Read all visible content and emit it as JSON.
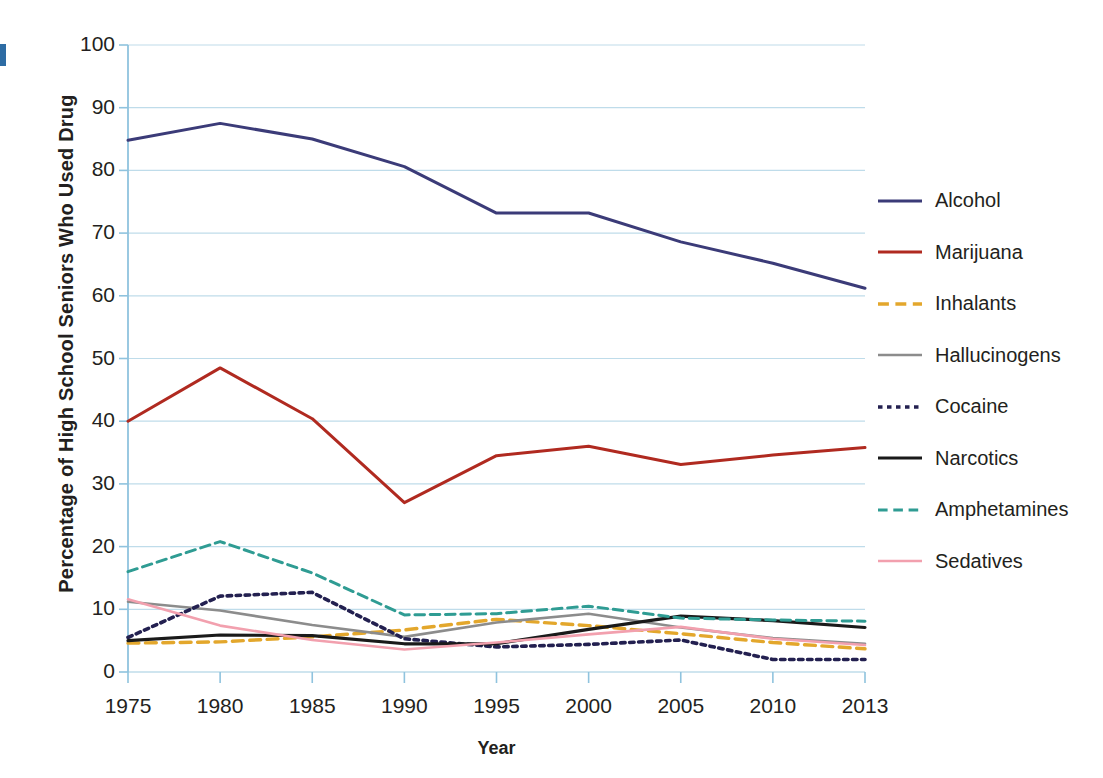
{
  "axes": {
    "y_title": "Percentage of High School Seniors Who Used Drug",
    "x_title": "Year",
    "y_ticks": [
      "0",
      "10",
      "20",
      "30",
      "40",
      "50",
      "60",
      "70",
      "80",
      "90",
      "100"
    ],
    "x_ticks": [
      "1975",
      "1980",
      "1985",
      "1990",
      "1995",
      "2000",
      "2005",
      "2010",
      "2013"
    ]
  },
  "legend": {
    "items": [
      {
        "label": "Alcohol",
        "color": "#3b3b78",
        "style": "solid",
        "width": 3.0
      },
      {
        "label": "Marijuana",
        "color": "#b02a20",
        "style": "solid",
        "width": 3.0
      },
      {
        "label": "Inhalants",
        "color": "#e3a72c",
        "style": "dashed",
        "width": 3.4
      },
      {
        "label": "Hallucinogens",
        "color": "#8c8c8c",
        "style": "solid",
        "width": 2.6
      },
      {
        "label": "Cocaine",
        "color": "#232050",
        "style": "dotted",
        "width": 3.6
      },
      {
        "label": "Narcotics",
        "color": "#1a1a1a",
        "style": "solid",
        "width": 3.2
      },
      {
        "label": "Amphetamines",
        "color": "#2f9c93",
        "style": "dashed",
        "width": 3.0
      },
      {
        "label": "Sedatives",
        "color": "#f2a0ae",
        "style": "solid",
        "width": 2.6
      }
    ]
  },
  "colors": {
    "gridline": "#bfdcea",
    "axis_line": "#8fc3de",
    "text": "#231f20",
    "background": "#ffffff",
    "edge_artifact": "#2e6ca4"
  },
  "chart_data": {
    "type": "line",
    "title": "",
    "xlabel": "Year",
    "ylabel": "Percentage of High School Seniors Who Used Drug",
    "x": [
      1975,
      1980,
      1985,
      1990,
      1995,
      2000,
      2005,
      2010,
      2013
    ],
    "xtick_labels": [
      "1975",
      "1980",
      "1985",
      "1990",
      "1995",
      "2000",
      "2005",
      "2010",
      "2013"
    ],
    "ylim": [
      0,
      100
    ],
    "ytick_step": 10,
    "grid": "horizontal",
    "legend_position": "right",
    "series": [
      {
        "name": "Alcohol",
        "color": "#3b3b78",
        "style": "solid",
        "values": [
          84.8,
          87.5,
          85.0,
          80.6,
          73.2,
          73.2,
          68.6,
          65.2,
          61.2
        ]
      },
      {
        "name": "Marijuana",
        "color": "#b02a20",
        "style": "solid",
        "values": [
          40.0,
          48.5,
          40.4,
          27.0,
          34.5,
          36.0,
          33.1,
          34.6,
          35.8
        ]
      },
      {
        "name": "Inhalants",
        "color": "#e3a72c",
        "style": "dashed",
        "values": [
          4.6,
          4.8,
          5.6,
          6.7,
          8.4,
          7.4,
          6.1,
          4.7,
          3.7
        ]
      },
      {
        "name": "Hallucinogens",
        "color": "#8c8c8c",
        "style": "solid",
        "values": [
          11.2,
          9.8,
          7.5,
          5.6,
          7.9,
          9.3,
          7.1,
          5.4,
          4.5
        ]
      },
      {
        "name": "Cocaine",
        "color": "#232050",
        "style": "dotted",
        "values": [
          5.5,
          12.1,
          12.7,
          5.3,
          4.0,
          4.4,
          5.1,
          2.0,
          2.0
        ]
      },
      {
        "name": "Narcotics",
        "color": "#1a1a1a",
        "style": "solid",
        "values": [
          5.0,
          5.9,
          5.8,
          4.5,
          4.5,
          6.8,
          8.9,
          8.2,
          7.1
        ]
      },
      {
        "name": "Amphetamines",
        "color": "#2f9c93",
        "style": "dashed",
        "values": [
          16.0,
          20.8,
          15.8,
          9.1,
          9.3,
          10.5,
          8.6,
          8.3,
          8.1
        ]
      },
      {
        "name": "Sedatives",
        "color": "#f2a0ae",
        "style": "solid",
        "values": [
          11.6,
          7.4,
          5.1,
          3.6,
          4.7,
          6.0,
          7.2,
          5.3,
          4.3
        ]
      }
    ]
  }
}
